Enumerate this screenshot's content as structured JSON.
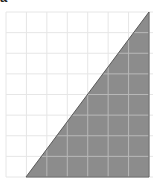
{
  "figure": {
    "label": "a",
    "grid": {
      "x0": 6,
      "y0": 12,
      "x1": 149,
      "y1": 177,
      "cols": 7,
      "rows": 8,
      "line_color": "#e6e6e6",
      "line_color_on_fill": "#b8b8b8"
    },
    "triangle": {
      "points": [
        [
          26,
          177
        ],
        [
          149,
          12
        ],
        [
          149,
          177
        ]
      ],
      "fill": "#8c8c8c",
      "stroke": "#5a5a5a"
    },
    "background": "#ffffff"
  }
}
